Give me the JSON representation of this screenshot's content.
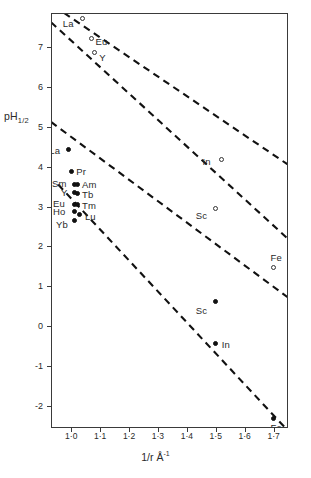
{
  "chart_data": {
    "type": "scatter",
    "title": "",
    "xlabel": "1/r Å",
    "xlabel_sup": "-1",
    "ylabel": "pH",
    "ylabel_sub": "1/2",
    "xlim": [
      0.93,
      1.75
    ],
    "ylim": [
      -2.55,
      7.85
    ],
    "grid": false,
    "legend": "none",
    "xticks": [
      "1·0",
      "1·1",
      "1·2",
      "1·3",
      "1·4",
      "1·5",
      "1·6",
      "1·7"
    ],
    "xtick_values": [
      1.0,
      1.1,
      1.2,
      1.3,
      1.4,
      1.5,
      1.6,
      1.7
    ],
    "yticks": [
      "7",
      "6",
      "5",
      "4",
      "3",
      "2",
      "1",
      "0",
      "-1",
      "-2"
    ],
    "ytick_values": [
      7,
      6,
      5,
      4,
      3,
      2,
      1,
      0,
      -1,
      -2
    ],
    "series": [
      {
        "name": "upper-series-open",
        "marker": "open-circle",
        "points": [
          {
            "label": "La",
            "x": 1.04,
            "y": 7.72,
            "lx": -20,
            "ly": 7
          },
          {
            "label": "Eu",
            "x": 1.07,
            "y": 7.22,
            "lx": 4,
            "ly": 5
          },
          {
            "label": "Y",
            "x": 1.08,
            "y": 6.86,
            "lx": 5,
            "ly": 6
          },
          {
            "label": "In",
            "x": 1.52,
            "y": 4.18,
            "lx": -19,
            "ly": 4
          },
          {
            "label": "Sc",
            "x": 1.5,
            "y": 2.96,
            "lx": -20,
            "ly": 9
          },
          {
            "label": "Fe",
            "x": 1.7,
            "y": 1.46,
            "lx": -3,
            "ly": -9
          }
        ]
      },
      {
        "name": "lower-series-filled",
        "marker": "filled-circle",
        "points": [
          {
            "label": "La",
            "x": 0.99,
            "y": 4.44,
            "lx": -19,
            "ly": 3
          },
          {
            "label": "Pr",
            "x": 1.0,
            "y": 3.88,
            "lx": 5,
            "ly": 2
          },
          {
            "label": "Sm",
            "x": 1.01,
            "y": 3.56,
            "lx": -22,
            "ly": 1
          },
          {
            "label": "Am",
            "x": 1.02,
            "y": 3.55,
            "lx": 5,
            "ly": 1
          },
          {
            "label": "Y",
            "x": 1.01,
            "y": 3.34,
            "lx": -13,
            "ly": 1
          },
          {
            "label": "Tb",
            "x": 1.02,
            "y": 3.32,
            "lx": 5,
            "ly": 2
          },
          {
            "label": "Eu",
            "x": 1.01,
            "y": 3.06,
            "lx": -21,
            "ly": 1
          },
          {
            "label": "Tm",
            "x": 1.02,
            "y": 3.05,
            "lx": 5,
            "ly": 2
          },
          {
            "label": "Ho",
            "x": 1.01,
            "y": 2.88,
            "lx": -21,
            "ly": 2
          },
          {
            "label": "Lu",
            "x": 1.03,
            "y": 2.8,
            "lx": 5,
            "ly": 3
          },
          {
            "label": "Yb",
            "x": 1.01,
            "y": 2.66,
            "lx": -18,
            "ly": 6
          },
          {
            "label": "Sc",
            "x": 1.5,
            "y": 0.62,
            "lx": -20,
            "ly": 10
          },
          {
            "label": "In",
            "x": 1.5,
            "y": -0.42,
            "lx": 6,
            "ly": 3
          },
          {
            "label": "Fe",
            "x": 1.7,
            "y": -2.3,
            "lx": -3,
            "ly": 11
          }
        ]
      }
    ],
    "trend_lines": [
      {
        "name": "line-1",
        "x1": 0.975,
        "y1": 7.85,
        "x2": 1.75,
        "y2": 4.05,
        "style": "dashed"
      },
      {
        "name": "line-2",
        "x1": 0.93,
        "y1": 7.62,
        "x2": 1.75,
        "y2": 2.19,
        "style": "dashed"
      },
      {
        "name": "line-3",
        "x1": 0.93,
        "y1": 5.12,
        "x2": 1.75,
        "y2": 0.72,
        "style": "dashed"
      },
      {
        "name": "line-4",
        "x1": 0.955,
        "y1": 3.55,
        "x2": 1.75,
        "y2": -2.62,
        "style": "dashed"
      }
    ]
  }
}
